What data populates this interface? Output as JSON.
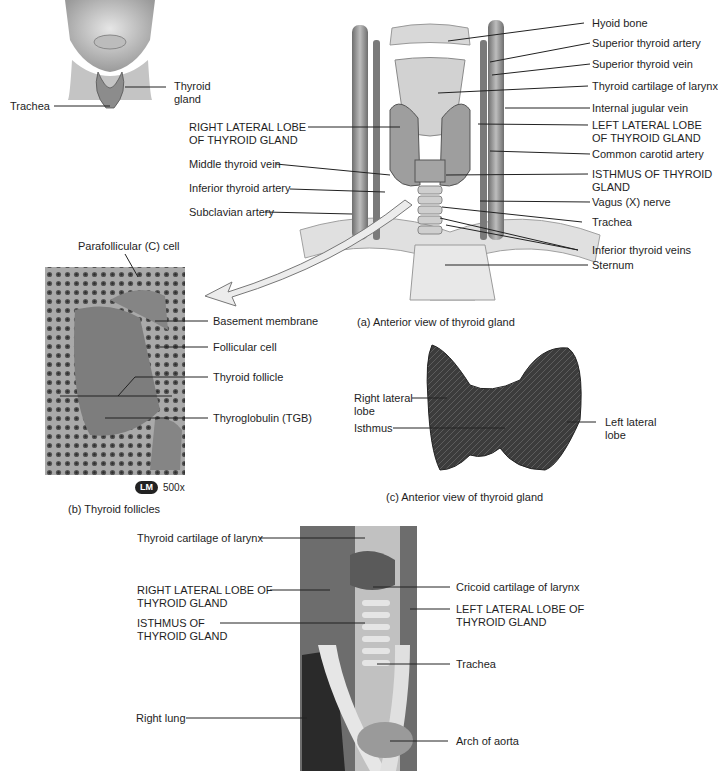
{
  "panel_a": {
    "inset_labels": [
      "Trachea",
      "Thyroid\ngland"
    ],
    "inset": {
      "trachea": "Trachea",
      "thyroid_1": "Thyroid",
      "thyroid_2": "gland"
    },
    "left_labels": {
      "right_lobe_1": "RIGHT LATERAL LOBE",
      "right_lobe_2": "OF THYROID GLAND",
      "middle_thyroid_vein": "Middle thyroid vein",
      "inferior_thyroid_artery": "Inferior thyroid artery",
      "subclavian_artery": "Subclavian artery"
    },
    "right_labels": {
      "hyoid_bone": "Hyoid bone",
      "superior_thyroid_artery": "Superior thyroid artery",
      "superior_thyroid_vein": "Superior thyroid vein",
      "thyroid_cartilage": "Thyroid cartilage of larynx",
      "internal_jugular_vein": "Internal jugular vein",
      "left_lobe_1": "LEFT LATERAL LOBE",
      "left_lobe_2": "OF THYROID GLAND",
      "common_carotid_artery": "Common carotid artery",
      "isthmus_1": "ISTHMUS OF THYROID",
      "isthmus_2": "GLAND",
      "vagus_nerve": "Vagus (X) nerve",
      "trachea": "Trachea",
      "inferior_thyroid_veins": "Inferior thyroid veins",
      "sternum": "Sternum"
    },
    "caption": "(a) Anterior view of thyroid gland"
  },
  "panel_b": {
    "labels": {
      "parafollicular": "Parafollicular (C) cell",
      "basement_membrane": "Basement membrane",
      "follicular_cell": "Follicular cell",
      "thyroid_follicle": "Thyroid follicle",
      "thyroglobulin": "Thyroglobulin (TGB)"
    },
    "badge": "LM",
    "magnification": "500x",
    "caption": "(b) Thyroid follicles"
  },
  "panel_c": {
    "labels": {
      "right_lobe_1": "Right lateral",
      "right_lobe_2": "lobe",
      "isthmus": "Isthmus",
      "left_lobe_1": "Left lateral",
      "left_lobe_2": "lobe"
    },
    "caption": "(c) Anterior view of thyroid gland"
  },
  "panel_d": {
    "labels": {
      "thyroid_cartilage": "Thyroid cartilage of larynx",
      "right_lobe_1": "RIGHT LATERAL LOBE OF",
      "right_lobe_2": "THYROID GLAND",
      "isthmus_1": "ISTHMUS OF",
      "isthmus_2": "THYROID GLAND",
      "right_lung": "Right lung",
      "cricoid_cartilage": "Cricoid cartilage of larynx",
      "left_lobe_1": "LEFT LATERAL LOBE OF",
      "left_lobe_2": "THYROID GLAND",
      "trachea": "Trachea",
      "arch_of_aorta": "Arch of aorta"
    }
  },
  "colors": {
    "tissue_dark": "#3a3a3a",
    "tissue_mid": "#8a8a8a",
    "tissue_light": "#d8d8d8",
    "leader": "#222222"
  }
}
